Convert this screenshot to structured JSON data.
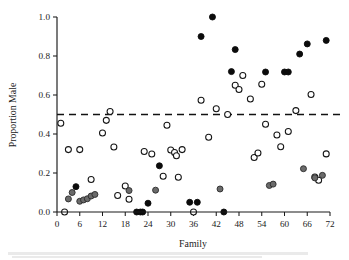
{
  "chart_data": {
    "type": "scatter",
    "title": "",
    "xlabel": "Family",
    "ylabel": "Proportion Male",
    "xlim": [
      0,
      72
    ],
    "ylim": [
      0.0,
      1.0
    ],
    "xticks": [
      0,
      6,
      12,
      18,
      24,
      30,
      36,
      42,
      48,
      54,
      60,
      66,
      72
    ],
    "yticks": [
      0.0,
      0.2,
      0.4,
      0.6,
      0.8,
      1.0
    ],
    "xtick_labels": [
      "0",
      "6",
      "12",
      "18",
      "24",
      "30",
      "36",
      "42",
      "48",
      "54",
      "60",
      "66",
      "72"
    ],
    "ytick_labels": [
      "0.0",
      "0.2",
      "0.4",
      "0.6",
      "0.8",
      "1.0"
    ],
    "grid": false,
    "legend": "none",
    "annotations": [
      {
        "type": "hline",
        "y": 0.5,
        "style": "dashed",
        "label": "0.50 reference line"
      }
    ],
    "series": [
      {
        "name": "open-circle",
        "marker": "open circle",
        "color": "#ffffff",
        "edge_color": "#151515",
        "points": [
          {
            "x": 1,
            "y": 0.455
          },
          {
            "x": 2,
            "y": 0.0
          },
          {
            "x": 3,
            "y": 0.32
          },
          {
            "x": 6,
            "y": 0.32
          },
          {
            "x": 9,
            "y": 0.167
          },
          {
            "x": 12,
            "y": 0.405
          },
          {
            "x": 13,
            "y": 0.47
          },
          {
            "x": 14,
            "y": 0.515
          },
          {
            "x": 15,
            "y": 0.333
          },
          {
            "x": 16,
            "y": 0.085
          },
          {
            "x": 18,
            "y": 0.133
          },
          {
            "x": 19,
            "y": 0.065
          },
          {
            "x": 23,
            "y": 0.31
          },
          {
            "x": 25,
            "y": 0.297
          },
          {
            "x": 28,
            "y": 0.183
          },
          {
            "x": 29,
            "y": 0.445
          },
          {
            "x": 30,
            "y": 0.318
          },
          {
            "x": 31,
            "y": 0.305
          },
          {
            "x": 31.5,
            "y": 0.288
          },
          {
            "x": 32,
            "y": 0.178
          },
          {
            "x": 33,
            "y": 0.32
          },
          {
            "x": 36,
            "y": 0.0
          },
          {
            "x": 38,
            "y": 0.573
          },
          {
            "x": 40,
            "y": 0.383
          },
          {
            "x": 42,
            "y": 0.53
          },
          {
            "x": 45,
            "y": 0.5
          },
          {
            "x": 47,
            "y": 0.65
          },
          {
            "x": 48,
            "y": 0.628
          },
          {
            "x": 49,
            "y": 0.7
          },
          {
            "x": 51,
            "y": 0.58
          },
          {
            "x": 52,
            "y": 0.28
          },
          {
            "x": 53,
            "y": 0.303
          },
          {
            "x": 54,
            "y": 0.655
          },
          {
            "x": 55,
            "y": 0.45
          },
          {
            "x": 58,
            "y": 0.395
          },
          {
            "x": 59,
            "y": 0.335
          },
          {
            "x": 61,
            "y": 0.413
          },
          {
            "x": 63,
            "y": 0.52
          },
          {
            "x": 67,
            "y": 0.603
          },
          {
            "x": 68,
            "y": 0.18
          },
          {
            "x": 69,
            "y": 0.163
          },
          {
            "x": 71,
            "y": 0.298
          }
        ]
      },
      {
        "name": "gray-filled-circle",
        "marker": "gray filled circle",
        "color": "#6b6b6b",
        "edge_color": "#2a2a2a",
        "points": [
          {
            "x": 3,
            "y": 0.067
          },
          {
            "x": 4,
            "y": 0.1
          },
          {
            "x": 6,
            "y": 0.055
          },
          {
            "x": 7,
            "y": 0.062
          },
          {
            "x": 8,
            "y": 0.068
          },
          {
            "x": 9,
            "y": 0.082
          },
          {
            "x": 10,
            "y": 0.09
          },
          {
            "x": 19,
            "y": 0.11
          },
          {
            "x": 26,
            "y": 0.112
          },
          {
            "x": 43,
            "y": 0.118
          },
          {
            "x": 56,
            "y": 0.136
          },
          {
            "x": 57,
            "y": 0.143
          },
          {
            "x": 65,
            "y": 0.222
          },
          {
            "x": 68,
            "y": 0.175
          },
          {
            "x": 70,
            "y": 0.188
          }
        ]
      },
      {
        "name": "black-filled-circle",
        "marker": "black filled circle",
        "color": "#0b0b0b",
        "edge_color": "#0b0b0b",
        "points": [
          {
            "x": 5,
            "y": 0.13
          },
          {
            "x": 21,
            "y": 0.0
          },
          {
            "x": 22,
            "y": 0.0
          },
          {
            "x": 22.6,
            "y": 0.0
          },
          {
            "x": 24,
            "y": 0.045
          },
          {
            "x": 27,
            "y": 0.237
          },
          {
            "x": 35,
            "y": 0.05
          },
          {
            "x": 37,
            "y": 0.05
          },
          {
            "x": 38,
            "y": 0.9
          },
          {
            "x": 41,
            "y": 1.0
          },
          {
            "x": 44,
            "y": 0.0
          },
          {
            "x": 46,
            "y": 0.72
          },
          {
            "x": 47,
            "y": 0.833
          },
          {
            "x": 55,
            "y": 0.718
          },
          {
            "x": 60,
            "y": 0.718
          },
          {
            "x": 61,
            "y": 0.718
          },
          {
            "x": 64,
            "y": 0.81
          },
          {
            "x": 66,
            "y": 0.862
          },
          {
            "x": 71,
            "y": 0.88
          }
        ]
      }
    ]
  }
}
